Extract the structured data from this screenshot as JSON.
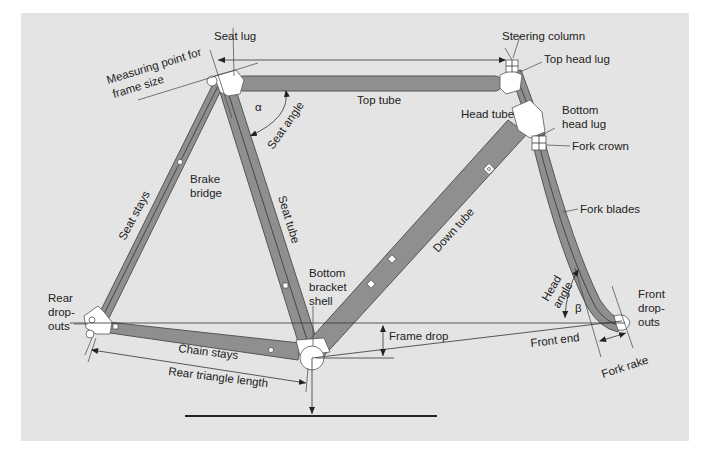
{
  "diagram": {
    "colors": {
      "panel": "#e4e4e4",
      "tube": "#8f8f8f",
      "tube_outline": "#555555",
      "lug": "#ffffff",
      "text": "#222222"
    },
    "labels": {
      "seat_lug": "Seat lug",
      "measuring_point_line1": "Measuring point for",
      "measuring_point_line2": "frame size",
      "steering_column": "Steering column",
      "top_head_lug": "Top head lug",
      "top_tube": "Top tube",
      "head_tube": "Head tube",
      "bottom_head_lug_line1": "Bottom",
      "bottom_head_lug_line2": "head lug",
      "fork_crown": "Fork crown",
      "seat_angle": "Seat angle",
      "alpha": "α",
      "brake_bridge_line1": "Brake",
      "brake_bridge_line2": "bridge",
      "seat_stays": "Seat stays",
      "seat_tube": "Seat tube",
      "down_tube": "Down tube",
      "fork_blades": "Fork blades",
      "bb_shell_line1": "Bottom",
      "bb_shell_line2": "bracket",
      "bb_shell_line3": "shell",
      "rear_dropouts_line1": "Rear",
      "rear_dropouts_line2": "drop-",
      "rear_dropouts_line3": "outs",
      "front_dropouts_line1": "Front",
      "front_dropouts_line2": "drop-",
      "front_dropouts_line3": "outs",
      "head_angle_line1": "Head",
      "head_angle_line2": "angle",
      "beta": "β",
      "frame_drop": "Frame drop",
      "front_end": "Front end",
      "fork_rake": "Fork rake",
      "chain_stays": "Chain stays",
      "rear_triangle_length": "Rear triangle length"
    }
  }
}
